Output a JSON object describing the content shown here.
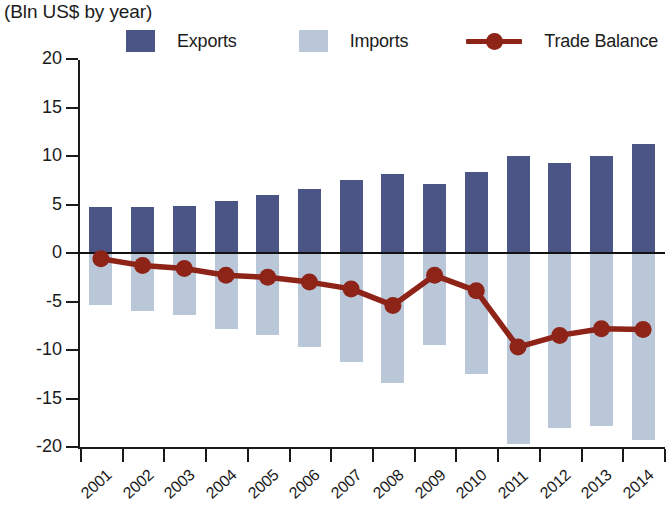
{
  "title": {
    "main": "",
    "subtitle": "(Bln US$ by year)"
  },
  "legend": {
    "position": "top",
    "items": [
      {
        "label": "Exports",
        "icon": "square-swatch",
        "color": "#4b5585"
      },
      {
        "label": "Imports",
        "icon": "square-swatch",
        "color": "#b9c7d9"
      },
      {
        "label": "Trade Balance",
        "icon": "line-marker",
        "color": "#8e2318"
      }
    ]
  },
  "axes": {
    "y": {
      "label": "",
      "ticks": [
        "20",
        "15",
        "10",
        "5",
        "0",
        "-5",
        "-10",
        "-15",
        "-20"
      ],
      "tick_values": [
        20,
        15,
        10,
        5,
        0,
        -5,
        -10,
        -15,
        -20
      ],
      "min": -20,
      "max": 20
    },
    "x": {
      "label": "",
      "ticks": [
        "2001",
        "2002",
        "2003",
        "2004",
        "2005",
        "2006",
        "2007",
        "2008",
        "2009",
        "2010",
        "2011",
        "2012",
        "2013",
        "2014"
      ]
    }
  },
  "chart_data": {
    "type": "bar",
    "title": "(Bln US$ by year)",
    "xlabel": "",
    "ylabel": "Bln US$",
    "ylim": [
      -20,
      20
    ],
    "grid": false,
    "legend_position": "top",
    "categories": [
      "2001",
      "2002",
      "2003",
      "2004",
      "2005",
      "2006",
      "2007",
      "2008",
      "2009",
      "2010",
      "2011",
      "2012",
      "2013",
      "2014"
    ],
    "series": [
      {
        "name": "Exports",
        "type": "bar",
        "color": "#4b5585",
        "values": [
          4.7,
          4.7,
          4.8,
          5.4,
          6.0,
          6.6,
          7.5,
          8.1,
          7.1,
          8.3,
          10.0,
          9.3,
          10.0,
          11.2
        ]
      },
      {
        "name": "Imports",
        "type": "bar",
        "color": "#b9c7d9",
        "values": [
          -5.4,
          -6.0,
          -6.4,
          -7.8,
          -8.5,
          -9.7,
          -11.2,
          -13.4,
          -9.5,
          -12.5,
          -19.7,
          -18.0,
          -17.8,
          -19.3
        ]
      },
      {
        "name": "Trade Balance",
        "type": "line",
        "color": "#8e2318",
        "values": [
          -0.6,
          -1.3,
          -1.6,
          -2.3,
          -2.5,
          -3.0,
          -3.7,
          -5.4,
          -2.3,
          -3.9,
          -9.7,
          -8.5,
          -7.8,
          -7.9
        ]
      }
    ]
  }
}
